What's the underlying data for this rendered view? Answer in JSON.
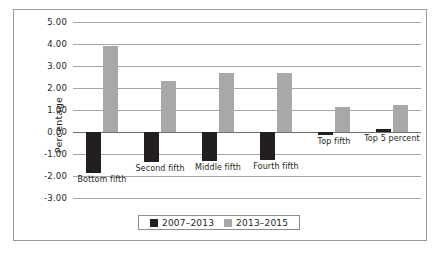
{
  "chart_data": {
    "type": "bar",
    "title": "",
    "xlabel": "",
    "ylabel": "Percentage",
    "ylim": [
      -3.0,
      5.0
    ],
    "ytick_step": 1.0,
    "grid": true,
    "legend_position": "bottom",
    "categories": [
      "Bottom fifth",
      "Second fifth",
      "Middle fifth",
      "Fourth fifth",
      "Top fifth",
      "Top 5 percent"
    ],
    "ytick_labels": [
      "5.00",
      "4.00",
      "3.00",
      "2.00",
      "1.00",
      "0.00",
      "-1.00",
      "-2.00",
      "-3.00"
    ],
    "series": [
      {
        "name": "2007–2013",
        "color": "#231f20",
        "values": [
          -1.85,
          -1.35,
          -1.3,
          -1.25,
          -0.15,
          0.12
        ]
      },
      {
        "name": "2013–2015",
        "color": "#a8a8a8",
        "values": [
          3.9,
          2.3,
          2.7,
          2.68,
          1.15,
          1.23
        ]
      }
    ]
  },
  "legend": {
    "items": [
      {
        "label": "2007–2013",
        "color": "#231f20"
      },
      {
        "label": "2013–2015",
        "color": "#a8a8a8"
      }
    ]
  },
  "caption_clipped": ""
}
